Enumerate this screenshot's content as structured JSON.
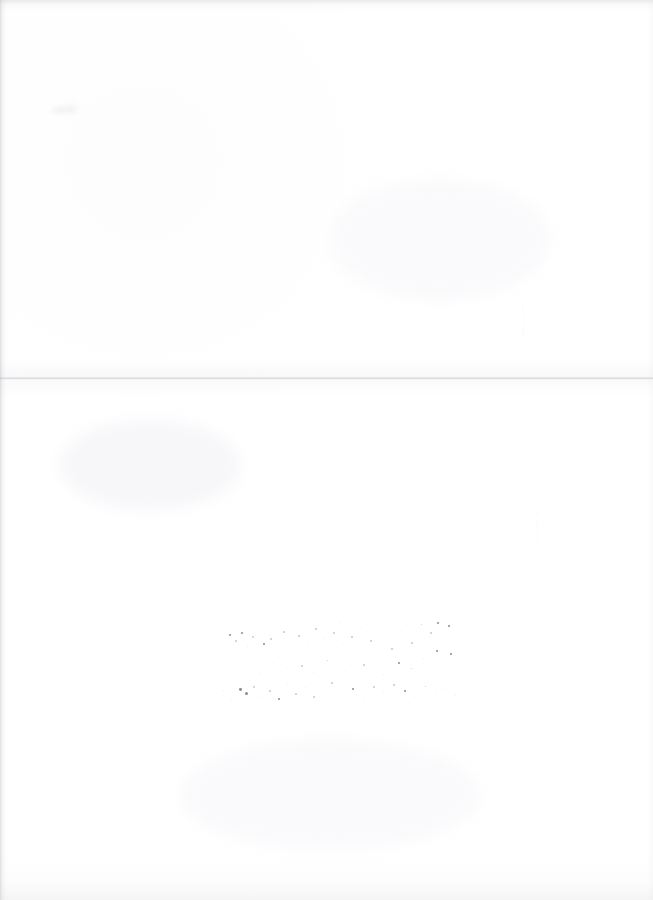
{
  "document": {
    "type": "scanned-page",
    "title": "Scanned blank page",
    "description": "Near-blank white scanned sheet with a horizontal fold crease, faint vertical marginalia along the right side, and scattered ink speckles in the lower middle area.",
    "width_px": 653,
    "height_px": 900,
    "background_color": "#ffffff",
    "page_body_text": ""
  },
  "artifacts": {
    "fold": {
      "name": "horizontal-fold-crease",
      "orientation": "horizontal",
      "y_px": 378,
      "color": "#b2b2b8"
    },
    "margin_notes": [
      {
        "id": "margin-note-upper",
        "text": "··· ·· ·····",
        "orientation": "vertical",
        "x_px": 519,
        "y_px": 303,
        "legible": false
      },
      {
        "id": "margin-note-lower",
        "text": "·· ··· ····",
        "orientation": "vertical",
        "x_px": 533,
        "y_px": 512,
        "legible": false
      }
    ],
    "smudges": [
      {
        "id": "smudge-upper-left",
        "x_px": 46,
        "y_px": 99,
        "width_px": 40,
        "height_px": 24
      }
    ],
    "speckle_cluster": {
      "name": "ink-speckle-cluster",
      "region": {
        "x_px": 215,
        "y_px": 610,
        "width_px": 250,
        "height_px": 100
      },
      "count": 78
    },
    "edges": {
      "left_shadow": true,
      "top_shadow": true,
      "bottom_shadow": true,
      "right_shadow": true,
      "shadow_color": "#96969b"
    }
  }
}
